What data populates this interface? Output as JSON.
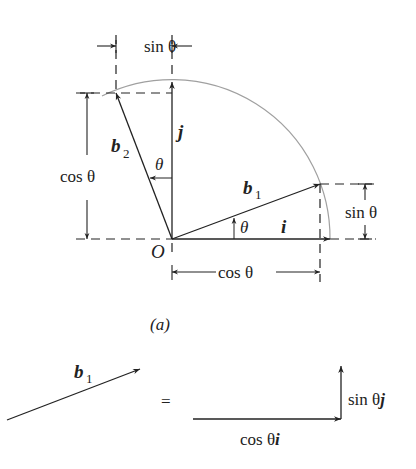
{
  "figure": {
    "panel_label": "(a)",
    "origin_label": "O",
    "labels": {
      "unit_i": "i",
      "unit_j": "j",
      "b1": "b",
      "b1_sub": "1",
      "b2": "b",
      "b2_sub": "2",
      "theta_at_b1": "θ",
      "theta_at_b2": "θ",
      "top_dim": "sin θ",
      "left_dim": "cos θ",
      "right_dim": "sin θ",
      "bottom_dim": "cos θ"
    },
    "colors": {
      "ink": "#222222",
      "arc": "#a0a0a0"
    }
  },
  "equation": {
    "lhs_label": "b",
    "lhs_sub": "1",
    "equals": "=",
    "horizontal_component": "cos θ",
    "horizontal_unit": "i",
    "vertical_component": "sin θ",
    "vertical_unit": "j"
  }
}
